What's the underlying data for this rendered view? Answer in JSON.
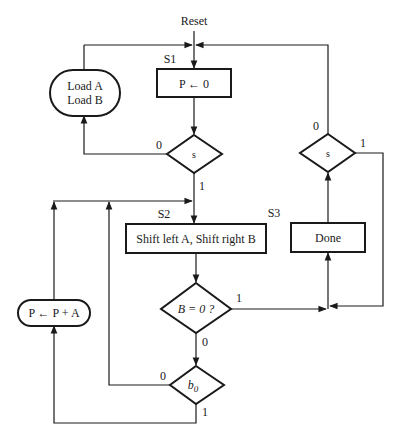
{
  "diagram": {
    "type": "ASM flowchart",
    "entry": {
      "label": "Reset"
    },
    "states": [
      {
        "id": "S1",
        "label": "S1",
        "action": "P ← 0"
      },
      {
        "id": "S2",
        "label": "S2",
        "action": "Shift left A, Shift right B"
      },
      {
        "id": "S3",
        "label": "S3",
        "action": "Done"
      }
    ],
    "conditional_outputs": [
      {
        "id": "load",
        "line1": "Load A",
        "line2": "Load B"
      },
      {
        "id": "add",
        "text": "P ← P + A"
      }
    ],
    "decisions": [
      {
        "id": "s_left",
        "text": "s",
        "yes": "1",
        "no": "0"
      },
      {
        "id": "s_right",
        "text": "s",
        "yes": "1",
        "no": "0"
      },
      {
        "id": "bzero",
        "text": "B = 0 ?",
        "yes": "1",
        "no": "0"
      },
      {
        "id": "b0",
        "text": "b",
        "subscript": "0",
        "yes": "1",
        "no": "0"
      }
    ]
  }
}
